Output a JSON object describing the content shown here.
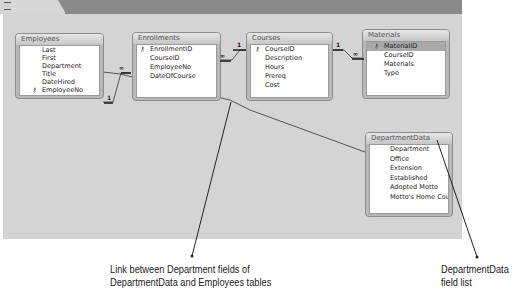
{
  "tab": {
    "label": "Relationships",
    "icon": "relationships-icon"
  },
  "tables": [
    {
      "id": "employees",
      "title": "Employees",
      "fields": [
        {
          "name": "Last",
          "key": false
        },
        {
          "name": "First",
          "key": false
        },
        {
          "name": "Department",
          "key": false
        },
        {
          "name": "Title",
          "key": false
        },
        {
          "name": "DateHired",
          "key": false
        },
        {
          "name": "EmployeeNo",
          "key": true
        }
      ]
    },
    {
      "id": "enrollments",
      "title": "Enrollments",
      "fields": [
        {
          "name": "EnrollmentID",
          "key": true
        },
        {
          "name": "CourseID",
          "key": false
        },
        {
          "name": "EmployeeNo",
          "key": false
        },
        {
          "name": "DateOfCourse",
          "key": false
        }
      ]
    },
    {
      "id": "courses",
      "title": "Courses",
      "fields": [
        {
          "name": "CourseID",
          "key": true
        },
        {
          "name": "Description",
          "key": false
        },
        {
          "name": "Hours",
          "key": false
        },
        {
          "name": "Prereq",
          "key": false
        },
        {
          "name": "Cost",
          "key": false
        }
      ]
    },
    {
      "id": "materials",
      "title": "Materials",
      "fields": [
        {
          "name": "MaterialID",
          "key": true,
          "selected": true
        },
        {
          "name": "CourseID",
          "key": false
        },
        {
          "name": "Materials",
          "key": false
        },
        {
          "name": "Type",
          "key": false
        }
      ]
    },
    {
      "id": "departmentdata",
      "title": "DepartmentData",
      "fields": [
        {
          "name": "Department",
          "key": false
        },
        {
          "name": "Office",
          "key": false
        },
        {
          "name": "Extension",
          "key": false
        },
        {
          "name": "Established",
          "key": false
        },
        {
          "name": "Adopted Motto",
          "key": false
        },
        {
          "name": "Motto's Home Cou",
          "key": false
        }
      ]
    }
  ],
  "relationships": [
    {
      "from": "Employees.EmployeeNo",
      "to": "Enrollments.EmployeeNo",
      "one": "1",
      "many": "∞"
    },
    {
      "from": "Courses.CourseID",
      "to": "Enrollments.CourseID",
      "one": "1",
      "many": "∞"
    },
    {
      "from": "Courses.CourseID",
      "to": "Materials.CourseID",
      "one": "1",
      "many": "∞"
    },
    {
      "from": "Employees.Department",
      "to": "DepartmentData.Department"
    }
  ],
  "symbols": {
    "one": "1",
    "many": "∞",
    "key": "🔑"
  },
  "annotations": {
    "link": {
      "line1": "Link between Department fields of",
      "line2": "DepartmentData and Employees tables"
    },
    "fieldlist": {
      "line1": "DepartmentData",
      "line2": "field list"
    }
  },
  "colors": {
    "canvas": "#d4d4d4",
    "tabbar": "#8a8a8a",
    "selected_field": "#a9a9a9"
  }
}
